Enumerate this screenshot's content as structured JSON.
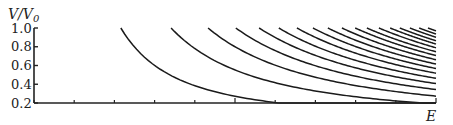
{
  "chart_data": {
    "type": "line",
    "title": "",
    "xlabel": "E",
    "ylabel": "V/V0",
    "xlim": [
      0,
      10
    ],
    "ylim": [
      0.2,
      1.0
    ],
    "yticks": [
      0.2,
      0.4,
      0.6,
      0.8,
      1.0
    ],
    "ytick_labels": [
      "0.2",
      "0.4",
      "0.6",
      "0.8",
      "1.0"
    ],
    "xticks": [
      0,
      1,
      2,
      3,
      4,
      5,
      6,
      7,
      8,
      9,
      10
    ],
    "xtick_labels": [],
    "grid": false,
    "legend": null,
    "exponent": 1.55,
    "series_description": "Family of decreasing curves V/V0 = (E_n/E)^p starting at V/V0 = 1.0 at E = E_n, clipped at 0.2",
    "curve_start_E": [
      2.16,
      3.41,
      4.33,
      5.02,
      5.6,
      6.09,
      6.54,
      6.94,
      7.31,
      7.66,
      7.99,
      8.28,
      8.58,
      8.86,
      9.1,
      9.35,
      9.58,
      9.8
    ]
  },
  "labels": {
    "y_axis_title_main": "V/V",
    "y_axis_title_sub": "0",
    "x_axis_title": "E"
  }
}
